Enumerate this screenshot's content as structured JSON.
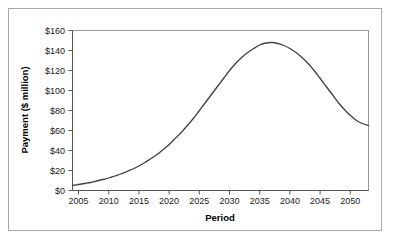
{
  "chart_data": {
    "type": "line",
    "title": "",
    "xlabel": "Period",
    "ylabel": "Payment ($ million)",
    "xlim": [
      2005,
      2054
    ],
    "ylim": [
      0,
      160
    ],
    "xticks": [
      2005,
      2010,
      2015,
      2020,
      2025,
      2030,
      2035,
      2040,
      2045,
      2050
    ],
    "xtick_labels": [
      "2005",
      "2010",
      "2015",
      "2020",
      "2025",
      "2030",
      "2035",
      "2040",
      "2045",
      "2050"
    ],
    "yticks": [
      0,
      20,
      40,
      60,
      80,
      100,
      120,
      140,
      160
    ],
    "ytick_labels": [
      "$0",
      "$20",
      "$40",
      "$60",
      "$80",
      "$100",
      "$120",
      "$140",
      "$160"
    ],
    "grid": false,
    "legend": null,
    "series": [
      {
        "name": "Payment",
        "color": "#404040",
        "x": [
          2005,
          2006,
          2007,
          2008,
          2009,
          2010,
          2011,
          2012,
          2013,
          2014,
          2015,
          2016,
          2017,
          2018,
          2019,
          2020,
          2021,
          2022,
          2023,
          2024,
          2025,
          2026,
          2027,
          2028,
          2029,
          2030,
          2031,
          2032,
          2033,
          2034,
          2035,
          2036,
          2037,
          2038,
          2039,
          2040,
          2041,
          2042,
          2043,
          2044,
          2045,
          2046,
          2047,
          2048,
          2049,
          2050,
          2051,
          2052,
          2053,
          2054
        ],
        "values": [
          5,
          6,
          7,
          8,
          9.5,
          11,
          12.5,
          14.5,
          16.5,
          19,
          21.5,
          24.5,
          28,
          32,
          36,
          41,
          46,
          52,
          58,
          65,
          72,
          80,
          88,
          96,
          104,
          112,
          120,
          127,
          133,
          138,
          142,
          145.5,
          147.5,
          148,
          147,
          145,
          142,
          138,
          133,
          127,
          120,
          112,
          104,
          96,
          88,
          81,
          75,
          70,
          67,
          65
        ]
      }
    ]
  },
  "axis": {
    "y_title": "Payment ($ million)",
    "x_title": "Period"
  }
}
